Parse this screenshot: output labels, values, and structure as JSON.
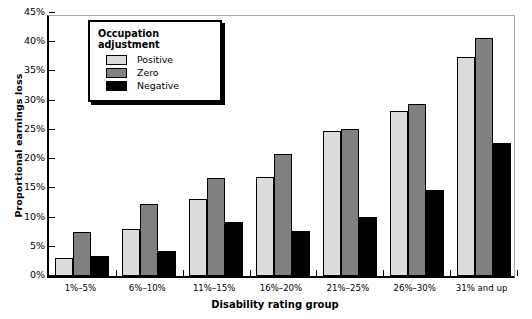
{
  "chart_data": {
    "type": "bar",
    "title": "",
    "xlabel": "Disability rating group",
    "ylabel": "Proportional earnings loss",
    "categories": [
      "1%–5%",
      "6%–10%",
      "11%–15%",
      "16%–20%",
      "21%–25%",
      "26%–30%",
      "31% and up"
    ],
    "series": [
      {
        "name": "Positive",
        "color": "#dcdcdc",
        "values": [
          3.0,
          8.0,
          13.2,
          17.0,
          24.8,
          28.3,
          37.5
        ]
      },
      {
        "name": "Zero",
        "color": "#808080",
        "values": [
          7.5,
          12.3,
          16.8,
          20.8,
          25.2,
          29.5,
          40.7
        ]
      },
      {
        "name": "Negative",
        "color": "#000000",
        "values": [
          3.4,
          4.3,
          9.3,
          7.7,
          10.1,
          14.7,
          22.7
        ]
      }
    ],
    "ylim": [
      0,
      45
    ],
    "yticks": [
      0,
      5,
      10,
      15,
      20,
      25,
      30,
      35,
      40,
      45
    ],
    "ytick_labels": [
      "0%",
      "5%",
      "10%",
      "15%",
      "20%",
      "25%",
      "30%",
      "35%",
      "40%",
      "45%"
    ],
    "grid": false,
    "legend_position": "top-left",
    "legend_title": "Occupation adjustment"
  }
}
